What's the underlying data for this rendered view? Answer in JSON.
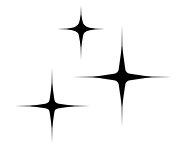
{
  "image": {
    "background": "#ffffff",
    "fill": "#000000",
    "icon": "sparkles-icon"
  },
  "stars": [
    {
      "name": "sparkle-top",
      "cx": 81,
      "cy": 29,
      "up": 24,
      "down": 31,
      "left": 24,
      "right": 24,
      "core": 6
    },
    {
      "name": "sparkle-right",
      "cx": 122,
      "cy": 77,
      "up": 52,
      "down": 50,
      "left": 49,
      "right": 50,
      "core": 8
    },
    {
      "name": "sparkle-bottom-left",
      "cx": 52,
      "cy": 106,
      "up": 38,
      "down": 37,
      "left": 37,
      "right": 38,
      "core": 6
    }
  ]
}
